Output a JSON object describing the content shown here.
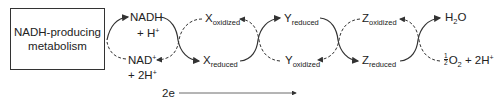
{
  "diagram": {
    "source_box": {
      "line1": "NADH-producing",
      "line2": "metabolism"
    },
    "nadh": {
      "main": "NADH",
      "second": "+ H",
      "second_sup": "+"
    },
    "nad": {
      "main": "NAD",
      "main_sup": "+",
      "second": "+ 2H",
      "second_sup": "+"
    },
    "x_oxidized": {
      "letter": "X",
      "state": "oxidized"
    },
    "x_reduced": {
      "letter": "X",
      "state": "reduced"
    },
    "y_reduced": {
      "letter": "Y",
      "state": "reduced"
    },
    "y_oxidized": {
      "letter": "Y",
      "state": "oxidized"
    },
    "z_oxidized": {
      "letter": "Z",
      "state": "oxidized"
    },
    "z_reduced": {
      "letter": "Z",
      "state": "reduced"
    },
    "water": {
      "h": "H",
      "sub": "2",
      "o": "O"
    },
    "oxygen": {
      "frac_num": "1",
      "frac_den": "2",
      "o": "O",
      "sub": "2",
      "rest": " + 2H",
      "sup": "+"
    },
    "electron_flow": {
      "label": "2e"
    },
    "colors": {
      "line": "#333333",
      "text": "#222222",
      "background": "#ffffff"
    }
  }
}
